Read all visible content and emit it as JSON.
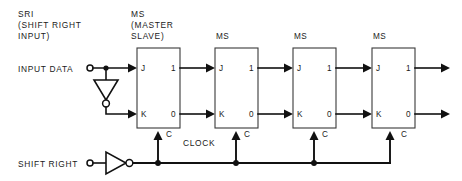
{
  "diagram": {
    "type": "logic-circuit-schematic",
    "colors": {
      "background": "#ffffff",
      "wire": "#111111",
      "block_outline": "#3a3a3a",
      "text": "#1a1a1a"
    },
    "annotations": {
      "sri_line1": "SRI",
      "sri_line2": "(SHIFT RIGHT",
      "sri_line3": "INPUT)",
      "ms_line1": "MS",
      "ms_line2": "(MASTER",
      "ms_line3": "SLAVE)",
      "input_data": "INPUT DATA",
      "shift_right": "SHIFT RIGHT",
      "clock": "CLOCK"
    },
    "blocks": [
      {
        "id": "ff1",
        "label": "MS",
        "caption": "(MASTER SLAVE)",
        "inputs": [
          "J",
          "K"
        ],
        "clock_pin": "C",
        "outputs": [
          "1",
          "0"
        ]
      },
      {
        "id": "ff2",
        "label": "MS",
        "caption": "",
        "inputs": [
          "J",
          "K"
        ],
        "clock_pin": "C",
        "outputs": [
          "1",
          "0"
        ]
      },
      {
        "id": "ff3",
        "label": "MS",
        "caption": "",
        "inputs": [
          "J",
          "K"
        ],
        "clock_pin": "C",
        "outputs": [
          "1",
          "0"
        ]
      },
      {
        "id": "ff4",
        "label": "MS",
        "caption": "",
        "inputs": [
          "J",
          "K"
        ],
        "clock_pin": "C",
        "outputs": [
          "1",
          "0"
        ]
      }
    ],
    "inverters": [
      {
        "id": "data-inverter",
        "orientation": "down",
        "note": "inverts INPUT DATA to drive K of first stage"
      },
      {
        "id": "clock-inverter",
        "orientation": "right",
        "note": "inverts SHIFT RIGHT to drive the clock bus"
      }
    ],
    "terminals": [
      {
        "id": "input-data-terminal",
        "label": "INPUT DATA"
      },
      {
        "id": "shift-right-terminal",
        "label": "SHIFT RIGHT"
      }
    ]
  }
}
